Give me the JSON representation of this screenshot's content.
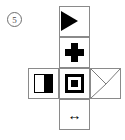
{
  "question": {
    "number": "5",
    "label_style": "circled-number"
  },
  "figure": {
    "type": "cube-net",
    "grid": {
      "rows": 4,
      "cols": 3,
      "cell_px": 31
    },
    "border_color": "#8a8a8a",
    "ink_color": "#000000",
    "background_color": "#ffffff",
    "cells": [
      {
        "id": "cell-top",
        "row": 0,
        "col": 1,
        "symbol_name": "black-right-triangle",
        "symbol_description": "solid black right-pointing triangle aligned to the left edge"
      },
      {
        "id": "cell-upper-middle",
        "row": 1,
        "col": 1,
        "symbol_name": "bold-plus-cross",
        "symbol_description": "thick black plus sign centered"
      },
      {
        "id": "cell-middle-left",
        "row": 2,
        "col": 0,
        "symbol_name": "half-filled-rectangle",
        "symbol_description": "outlined rectangle, left half white and right half solid black"
      },
      {
        "id": "cell-center",
        "row": 2,
        "col": 1,
        "symbol_name": "concentric-squares",
        "symbol_description": "black square outline containing a smaller solid black square"
      },
      {
        "id": "cell-middle-right",
        "row": 2,
        "col": 2,
        "symbol_name": "envelope-diagonals",
        "symbol_description": "two diagonal lines from the upper corners meeting near the centre, plus a diagonal to the lower-left corner"
      },
      {
        "id": "cell-bottom",
        "row": 3,
        "col": 1,
        "symbol_name": "double-headed-horizontal-arrow",
        "symbol_description": "left-right double arrow",
        "glyph": "↔"
      }
    ]
  }
}
